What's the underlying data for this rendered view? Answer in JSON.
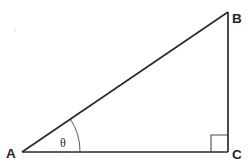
{
  "figure": {
    "kind": "geometry-diagram",
    "shape": "right-triangle",
    "background_color": "#ffffff",
    "line_color": "#2b2b2b",
    "mark_color": "#4a4a4a",
    "canvas": {
      "width": 248,
      "height": 166
    }
  },
  "vertices": {
    "a": {
      "label": "A",
      "x": 22,
      "y": 152,
      "label_x": 6,
      "label_y": 158
    },
    "b": {
      "label": "B",
      "x": 228,
      "y": 12,
      "label_x": 232,
      "label_y": 13
    },
    "c": {
      "label": "C",
      "x": 228,
      "y": 152,
      "label_x": 232,
      "label_y": 159
    }
  },
  "edges": [
    {
      "name": "hypotenuse-ab",
      "from": "A",
      "to": "B",
      "x1": 22,
      "y1": 152,
      "x2": 228,
      "y2": 12,
      "stroke_width": 1.7
    },
    {
      "name": "vertical-bc",
      "from": "B",
      "to": "C",
      "x1": 228,
      "y1": 12,
      "x2": 228,
      "y2": 152,
      "stroke_width": 1.7
    },
    {
      "name": "base-ac",
      "from": "A",
      "to": "C",
      "x1": 22,
      "y1": 152,
      "x2": 228,
      "y2": 152,
      "stroke_width": 1.7
    }
  ],
  "angle_arc": {
    "name": "theta-arc",
    "at_vertex": "A",
    "label": "θ",
    "label_x": 60,
    "label_y": 147,
    "radius": 58,
    "center_x": 22,
    "center_y": 152,
    "start_x": 80,
    "start_y": 152,
    "end_x": 70.2,
    "end_y": 118.8,
    "measure_degrees": 34
  },
  "right_angle_mark": {
    "name": "right-angle-square",
    "at_vertex": "C",
    "measure_degrees": 90,
    "size": 17,
    "path": "M 211 152 L 211 135 L 228 135"
  },
  "artifacts": [
    {
      "name": "paper-speck",
      "x": 14,
      "y": 28,
      "w": 2,
      "h": 4
    }
  ]
}
